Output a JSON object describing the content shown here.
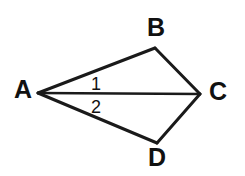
{
  "figure": {
    "background_color": "#ffffff",
    "line_color": "#1a1a1a",
    "text_color": "#111111"
  },
  "vertices": [
    {
      "name": "A",
      "label": "A",
      "x": 38,
      "y": 93,
      "label_x": 14,
      "label_y": 91,
      "anchor": "start"
    },
    {
      "name": "B",
      "label": "B",
      "x": 155,
      "y": 48,
      "label_x": 147,
      "label_y": 29,
      "anchor": "start"
    },
    {
      "name": "C",
      "label": "C",
      "x": 200,
      "y": 94,
      "label_x": 209,
      "label_y": 93,
      "anchor": "start"
    },
    {
      "name": "D",
      "label": "D",
      "x": 157,
      "y": 143,
      "label_x": 148,
      "label_y": 159,
      "anchor": "start"
    }
  ],
  "edges": [
    {
      "name": "AB",
      "from": "A",
      "to": "B",
      "points": "38,93 155,48"
    },
    {
      "name": "BC",
      "from": "B",
      "to": "C",
      "points": "155,48 200,94"
    },
    {
      "name": "CD",
      "from": "C",
      "to": "D",
      "points": "200,94 157,143"
    },
    {
      "name": "DA",
      "from": "D",
      "to": "A",
      "points": "157,143 38,93"
    }
  ],
  "diagonal": {
    "name": "AC",
    "from": "A",
    "to": "C",
    "points": "38,93 200,94"
  },
  "angle_labels": [
    {
      "name": "angle-1",
      "label": "1",
      "x": 96,
      "y": 85
    },
    {
      "name": "angle-2",
      "label": "2",
      "x": 96,
      "y": 108
    }
  ]
}
